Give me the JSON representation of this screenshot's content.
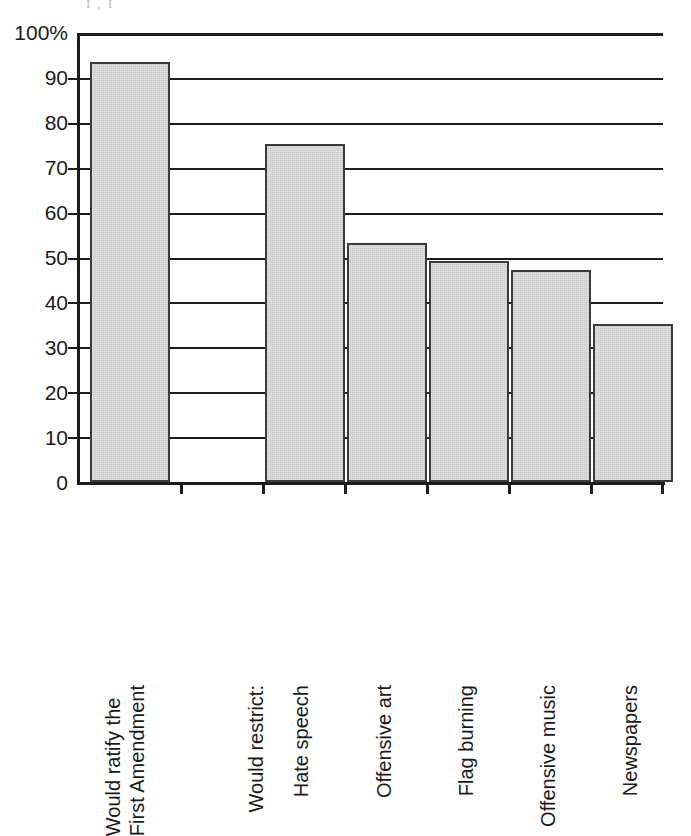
{
  "page": {
    "remnant_text": "I   ,                    I"
  },
  "chart_data": {
    "type": "bar",
    "title": "",
    "subtitle": "",
    "xlabel": "",
    "ylabel": "",
    "ylim": [
      0,
      100
    ],
    "ytick_step": 10,
    "grid": true,
    "legend": false,
    "legend_position": "none",
    "y_tick_labels": [
      "100%",
      "90",
      "80",
      "70",
      "60",
      "50",
      "40",
      "30",
      "20",
      "10",
      "0"
    ],
    "y_tick_values": [
      100,
      90,
      80,
      70,
      60,
      50,
      40,
      30,
      20,
      10,
      0
    ],
    "group_heading": "Would restrict:",
    "categories": [
      "Would ratify the First Amendment",
      "Would restrict:",
      "Hate speech",
      "Offensive art",
      "Flag burning",
      "Offensive music",
      "Newspapers"
    ],
    "values": [
      93.5,
      null,
      75.3,
      53.2,
      49.3,
      47.3,
      35.3
    ],
    "bars": [
      {
        "label_line1": "Would ratify the",
        "label_line2": "First Amendment",
        "value": 93.5
      },
      {
        "label_line1": "Would restrict:",
        "label_line2": "",
        "value": null
      },
      {
        "label_line1": "Hate speech",
        "label_line2": "",
        "value": 75.3
      },
      {
        "label_line1": "Offensive art",
        "label_line2": "",
        "value": 53.2
      },
      {
        "label_line1": "Flag burning",
        "label_line2": "",
        "value": 49.3
      },
      {
        "label_line1": "Offensive music",
        "label_line2": "",
        "value": 47.3
      },
      {
        "label_line1": "Newspapers",
        "label_line2": "",
        "value": 35.3
      }
    ],
    "colors": {
      "bar_fill": "#cacaca",
      "bar_edge": "#3a3a3a",
      "axis": "#1c1c1c",
      "grid": "#1c1c1c",
      "text": "#1a1a1a",
      "background": "#ffffff"
    }
  }
}
